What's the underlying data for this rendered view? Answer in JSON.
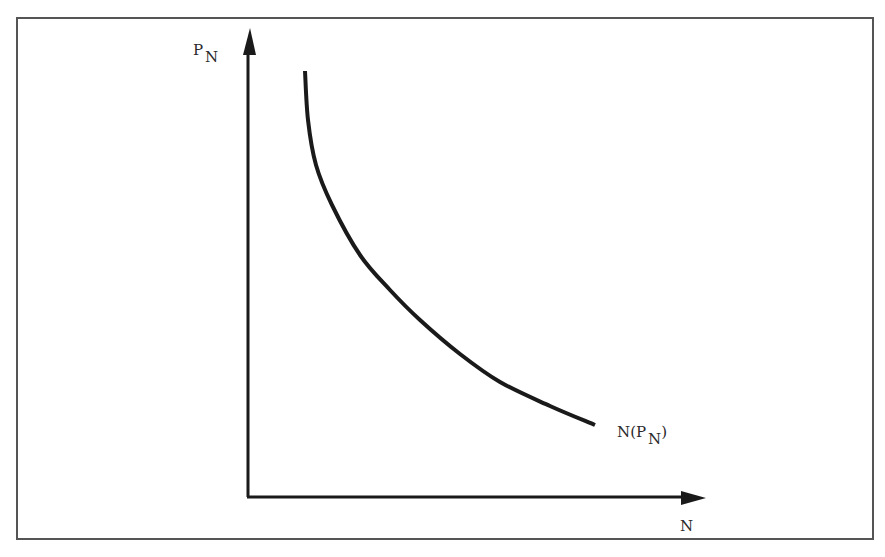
{
  "chart_data": {
    "type": "line",
    "title": "",
    "xlabel": "N",
    "ylabel": "P_N",
    "grid": false,
    "legend": null,
    "axis_ticks": {
      "x": [],
      "y": []
    },
    "series": [
      {
        "name": "N(P_N)",
        "label_main": "N(P",
        "label_sub": "N",
        "label_close": ")",
        "description": "Monotonically decreasing convex curve (demand-like): steep near top-left, flattening toward the lower right",
        "points_px": [
          [
            305,
            71
          ],
          [
            308,
            120
          ],
          [
            316,
            165
          ],
          [
            332,
            205
          ],
          [
            360,
            255
          ],
          [
            390,
            290
          ],
          [
            420,
            320
          ],
          [
            460,
            354
          ],
          [
            500,
            382
          ],
          [
            550,
            406
          ],
          [
            595,
            425
          ]
        ]
      }
    ],
    "annotations": [
      "N(P_N)"
    ]
  },
  "axes": {
    "y_label_main": "P",
    "y_label_sub": "N",
    "x_label": "N"
  },
  "colors": {
    "line": "#1a1a1a",
    "frame": "#555555",
    "background": "#ffffff"
  }
}
